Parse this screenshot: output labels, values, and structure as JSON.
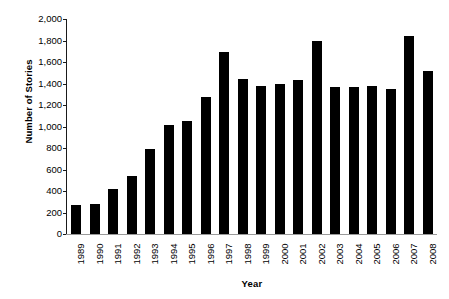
{
  "chart_data": {
    "type": "bar",
    "title": "",
    "subtitle": "",
    "xlabel": "Year",
    "ylabel": "Number of Stories",
    "categories": [
      "1989",
      "1990",
      "1991",
      "1992",
      "1993",
      "1994",
      "1995",
      "1996",
      "1997",
      "1998",
      "1999",
      "2000",
      "2001",
      "2002",
      "2003",
      "2004",
      "2005",
      "2006",
      "2007",
      "2008"
    ],
    "values": [
      270,
      280,
      415,
      540,
      795,
      1015,
      1055,
      1270,
      1690,
      1440,
      1375,
      1395,
      1430,
      1800,
      1370,
      1372,
      1378,
      1345,
      1845,
      1515
    ],
    "series": [
      {
        "name": "Number of Stories",
        "values": [
          270,
          280,
          415,
          540,
          795,
          1015,
          1055,
          1270,
          1690,
          1440,
          1375,
          1395,
          1430,
          1800,
          1370,
          1372,
          1378,
          1345,
          1845,
          1515
        ]
      }
    ],
    "ylim": [
      0,
      2000
    ],
    "ytick_step": 200,
    "ytick_labels": [
      "2,000",
      "1,800",
      "1,600",
      "1,400",
      "1,200",
      "1,000",
      "800",
      "600",
      "400",
      "200",
      "0"
    ],
    "ytick_values": [
      2000,
      1800,
      1600,
      1400,
      1200,
      1000,
      800,
      600,
      400,
      200,
      0
    ],
    "grid": false,
    "legend": false,
    "legend_position": "none",
    "bar_color": "#000000",
    "axis_color": "#1a1a1a",
    "background_color": "#ffffff",
    "xtick_rotation": -90,
    "annotations": []
  }
}
